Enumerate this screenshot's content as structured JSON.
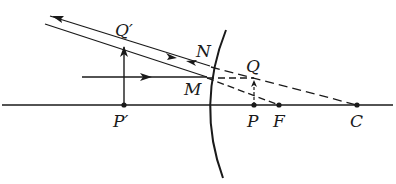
{
  "figure": {
    "type": "convex-mirror-ray-diagram",
    "stroke_color": "#1a1a1a",
    "background": "#ffffff"
  },
  "labels": {
    "q_prime": "Q′",
    "p_prime": "P′",
    "n": "N",
    "m": "M",
    "q": "Q",
    "p": "P",
    "f": "F",
    "c": "C"
  },
  "points": {
    "P_prime": [
      124,
      105
    ],
    "Q_prime": [
      124,
      45
    ],
    "M": [
      207,
      77
    ],
    "N": [
      210,
      65
    ],
    "P": [
      254,
      105
    ],
    "Q": [
      254,
      82
    ],
    "F": [
      279,
      105
    ],
    "C": [
      357,
      105
    ]
  },
  "elements": {
    "optical_axis": "horizontal line through P', P, F, C",
    "mirror": "curved mirror surface",
    "object": "arrow P'Q'",
    "image": "dashed arrow PQ",
    "rays": [
      "incident ray parallel to axis to M",
      "reflected ray from M through Q'",
      "ray from Q' to N reflected back",
      "dashed extensions to Q, F and C"
    ]
  }
}
